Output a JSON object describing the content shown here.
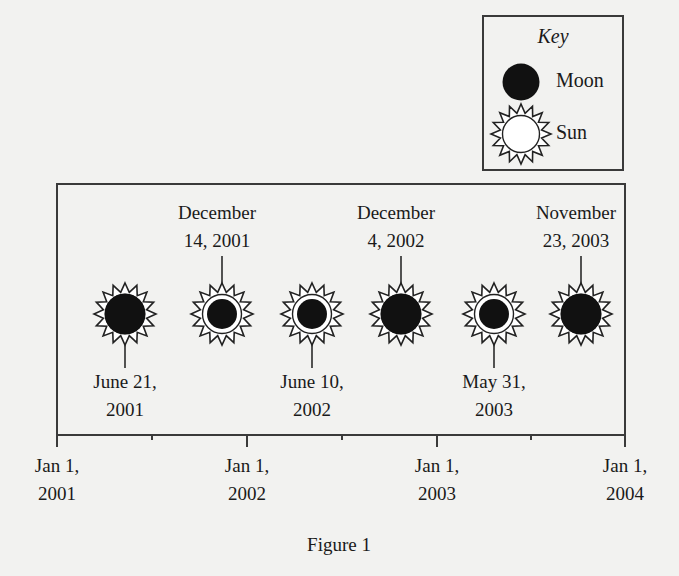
{
  "colors": {
    "background": "#f2f2f0",
    "ink": "#1a1a1a",
    "line": "#3a3a3a",
    "moon": "#111111",
    "sun_fill": "#ffffff"
  },
  "key": {
    "title": "Key",
    "items": [
      {
        "label": "Moon",
        "icon": "moon-icon"
      },
      {
        "label": "Sun",
        "icon": "sun-icon"
      }
    ]
  },
  "timeline": {
    "start": "Jan 1, 2001",
    "end": "Jan 1, 2004",
    "axis_ticks": [
      {
        "line1": "Jan 1,",
        "line2": "2001",
        "major": true
      },
      {
        "line1": "",
        "line2": "",
        "major": false
      },
      {
        "line1": "Jan 1,",
        "line2": "2002",
        "major": true
      },
      {
        "line1": "",
        "line2": "",
        "major": false
      },
      {
        "line1": "Jan 1,",
        "line2": "2003",
        "major": true
      },
      {
        "line1": "",
        "line2": "",
        "major": false
      },
      {
        "line1": "Jan 1,",
        "line2": "2004",
        "major": true
      }
    ],
    "events": [
      {
        "date_line1": "June 21,",
        "date_line2": "2001",
        "type": "total",
        "label_position": "below"
      },
      {
        "date_line1": "December",
        "date_line2": "14, 2001",
        "type": "annular",
        "label_position": "above"
      },
      {
        "date_line1": "June 10,",
        "date_line2": "2002",
        "type": "annular",
        "label_position": "below"
      },
      {
        "date_line1": "December",
        "date_line2": "4, 2002",
        "type": "total",
        "label_position": "above"
      },
      {
        "date_line1": "May 31,",
        "date_line2": "2003",
        "type": "annular",
        "label_position": "below"
      },
      {
        "date_line1": "November",
        "date_line2": "23, 2003",
        "type": "total",
        "label_position": "above"
      }
    ]
  },
  "caption": "Figure 1"
}
